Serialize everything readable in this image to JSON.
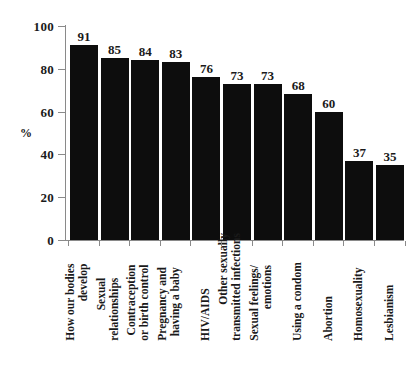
{
  "chart_data": {
    "type": "bar",
    "title": "",
    "subtitle": "",
    "xlabel": "",
    "ylabel": "%",
    "ylim": [
      0,
      100
    ],
    "grid": false,
    "legend": "none",
    "orientation": "vertical",
    "bar_color": "#0d0d0d",
    "axis_color": "#8a8a8a",
    "background": "#ffffff",
    "yticks": [
      0,
      20,
      40,
      60,
      80,
      100
    ],
    "ytick_labels": [
      "0",
      "20",
      "40",
      "60",
      "80",
      "100"
    ],
    "categories": [
      "How our bodies develop",
      "Sexual relationships",
      "Contraception or birth control",
      "Pregnancy and having a baby",
      "HIV/AIDS",
      "Other sexually transmitted infections",
      "Sexual feelings/emotions",
      "Using a condom",
      "Abortion",
      "Homosexuality",
      "Lesbianism"
    ],
    "category_lines": [
      [
        "How our bodies",
        "develop"
      ],
      [
        "Sexual",
        "relationships"
      ],
      [
        "Contraception",
        "or birth control"
      ],
      [
        "Pregnancy and",
        "having a baby"
      ],
      [
        "HIV/AIDS",
        ""
      ],
      [
        "Other sexually",
        "transmitted infections"
      ],
      [
        "Sexual feelings/",
        "emotions"
      ],
      [
        "Using a condom",
        ""
      ],
      [
        "Abortion",
        ""
      ],
      [
        "Homosexuality",
        ""
      ],
      [
        "Lesbianism",
        ""
      ]
    ],
    "values": [
      91,
      85,
      84,
      83,
      76,
      73,
      73,
      68,
      60,
      37,
      35
    ],
    "value_labels": [
      "91",
      "85",
      "84",
      "83",
      "76",
      "73",
      "73",
      "68",
      "60",
      "37",
      "35"
    ]
  }
}
